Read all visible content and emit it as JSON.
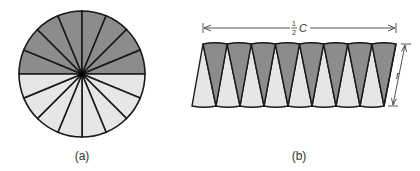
{
  "figure": {
    "panel_a": {
      "caption": "(a)",
      "center": [
        82,
        74
      ],
      "radius": 63,
      "sectors": 16,
      "top_half_color": "#8c8c8c",
      "bottom_half_color": "#e6e6e6"
    },
    "panel_b": {
      "caption": "(b)",
      "width_label_num": "1",
      "width_label_den": "2",
      "width_label_var": "C",
      "height_label": "r",
      "wedges_per_row": 8,
      "dark_color": "#8c8c8c",
      "light_color": "#e6e6e6"
    },
    "stroke_color": "#1a1a1a"
  }
}
